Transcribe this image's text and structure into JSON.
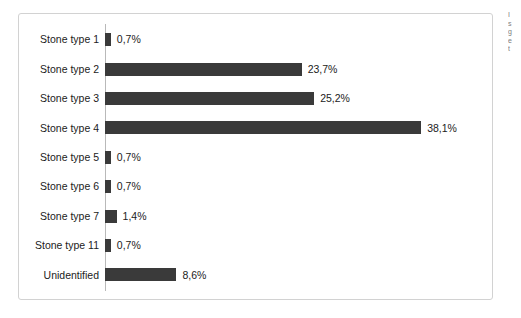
{
  "chart_data": {
    "type": "bar",
    "orientation": "horizontal",
    "title": "",
    "subtitle": "",
    "xlabel": "",
    "ylabel": "",
    "grid": false,
    "legend": "none",
    "xlim": [
      0,
      40
    ],
    "value_suffix": "%",
    "decimal_separator": ",",
    "bar_color": "#3a3a3a",
    "axis_color": "#b9b9b9",
    "border_color": "#d2d2d2",
    "categories": [
      "Stone type 1",
      "Stone type 2",
      "Stone type 3",
      "Stone type 4",
      "Stone type 5",
      "Stone type 6",
      "Stone type 7",
      "Stone type 11",
      "Unidentified"
    ],
    "values": [
      0.7,
      23.7,
      25.2,
      38.1,
      0.7,
      0.7,
      1.4,
      0.7,
      8.6
    ],
    "value_labels": [
      "0,7%",
      "23,7%",
      "25,2%",
      "38,1%",
      "0,7%",
      "0,7%",
      "1,4%",
      "0,7%",
      "8,6%"
    ]
  },
  "edge_fragment": {
    "lines": [
      "I",
      "s",
      "g",
      "e",
      "t"
    ]
  }
}
